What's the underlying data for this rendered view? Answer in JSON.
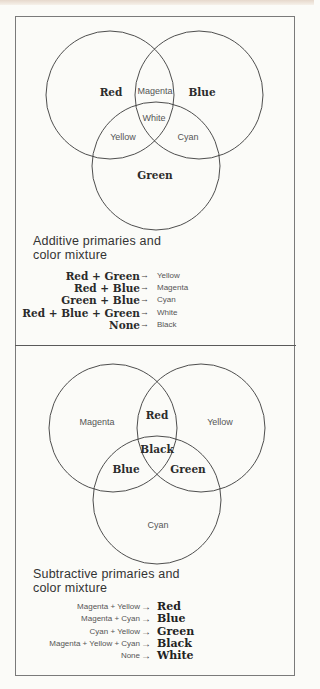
{
  "additive": {
    "title_line1": "Additive primaries and",
    "title_line2": "color mixture",
    "regions": {
      "red": "Red",
      "blue": "Blue",
      "green": "Green",
      "magenta": "Magenta",
      "yellow": "Yellow",
      "cyan": "Cyan",
      "white": "White"
    },
    "equations": [
      {
        "lhs": "Red + Green",
        "arrow": "→",
        "rhs": "Yellow"
      },
      {
        "lhs": "Red + Blue",
        "arrow": "→",
        "rhs": "Magenta"
      },
      {
        "lhs": "Green + Blue",
        "arrow": "→",
        "rhs": "Cyan"
      },
      {
        "lhs": "Red + Blue + Green",
        "arrow": "→",
        "rhs": "White"
      },
      {
        "lhs": "None",
        "arrow": "→",
        "rhs": "Black"
      }
    ]
  },
  "subtractive": {
    "title_line1": "Subtractive primaries and",
    "title_line2": "color mixture",
    "regions": {
      "magenta": "Magenta",
      "yellow": "Yellow",
      "cyan": "Cyan",
      "red": "Red",
      "blue": "Blue",
      "green": "Green",
      "black": "Black"
    },
    "equations": [
      {
        "lhs": "Magenta + Yellow",
        "arrow": "→",
        "rhs": "Red"
      },
      {
        "lhs": "Magenta + Cyan",
        "arrow": "→",
        "rhs": "Blue"
      },
      {
        "lhs": "Cyan + Yellow",
        "arrow": "→",
        "rhs": "Green"
      },
      {
        "lhs": "Magenta + Yellow + Cyan",
        "arrow": "→",
        "rhs": "Black"
      },
      {
        "lhs": "None",
        "arrow": "→",
        "rhs": "White"
      }
    ]
  },
  "colors": {
    "background": "#fbfbf8",
    "stroke": "#3a3a3a",
    "frame": "#7a7a7a"
  }
}
